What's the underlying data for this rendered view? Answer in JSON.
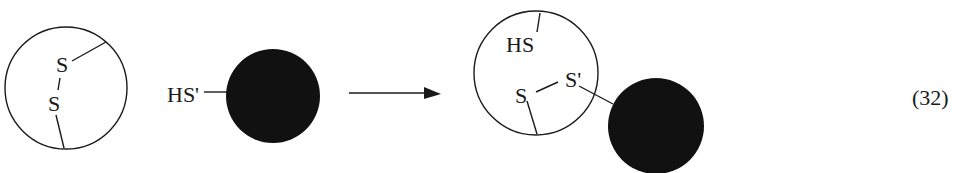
{
  "diagram": {
    "type": "reaction-scheme",
    "reactant_1": {
      "shape": "open-circle",
      "labels": {
        "sulfur_top": "S",
        "sulfur_bottom": "S"
      },
      "description": "protein with intramolecular disulfide bond"
    },
    "reactant_2": {
      "shape": "filled-circle",
      "label": "HS'",
      "description": "thiol-bearing molecule"
    },
    "arrow": {
      "direction": "right"
    },
    "product": {
      "open_circle": {
        "labels": {
          "thiol": "HS",
          "sulfur": "S",
          "sulfur_prime": "S'"
        }
      },
      "filled_circle": {
        "linked_via": "S'"
      },
      "description": "mixed disulfide product"
    },
    "equation_number": "(32)",
    "colors": {
      "stroke": "#1a1a1a",
      "fill_dark": "#111111",
      "background": "#ffffff"
    }
  }
}
